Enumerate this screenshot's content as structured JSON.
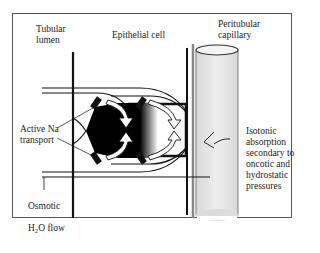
{
  "labels": {
    "tubular_lumen": "Tubular\nlumen",
    "epithelial_cell": "Epithelial cell",
    "peritubular_capillary": "Peritubular\ncapillary",
    "active_na_transport": "Active Na\ntransport",
    "osmotic_h2o_flow_line1": "Osmotic",
    "osmotic_h2o_flow_line2": "H₂O flow",
    "isotonic_absorption": "Isotonic\nabsorption\nsecondary to\noncotic and\nhydrostatic\npressures"
  },
  "colors": {
    "ink": "#111111",
    "capillary_fill": "#e6e6e6",
    "capillary_wall": "#888888",
    "frame": "#555555"
  }
}
